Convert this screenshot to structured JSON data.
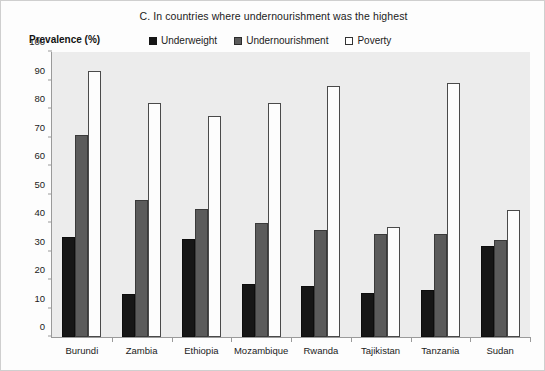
{
  "chart_data": {
    "type": "bar",
    "title": "C. In countries where undernourishment was the highest",
    "xlabel": "",
    "ylabel": "Prevalence (%)",
    "ylim": [
      0,
      100
    ],
    "yticks": [
      0,
      10,
      20,
      30,
      40,
      50,
      60,
      70,
      80,
      90,
      100
    ],
    "grid": false,
    "legend_position": "top",
    "categories": [
      "Burundi",
      "Zambia",
      "Ethiopia",
      "Mozambique",
      "Rwanda",
      "Tajikistan",
      "Tanzania",
      "Sudan"
    ],
    "series": [
      {
        "name": "Underweight",
        "color": "#161616",
        "values": [
          35,
          15,
          34.5,
          18.5,
          18,
          15.5,
          16.5,
          32
        ]
      },
      {
        "name": "Undernourishment",
        "color": "#5b5b5b",
        "values": [
          71,
          48,
          45,
          40,
          37.5,
          36,
          36,
          34
        ]
      },
      {
        "name": "Poverty",
        "color": "#ffffff",
        "values": [
          93.5,
          82,
          77.5,
          82,
          88,
          38.5,
          89,
          44.5
        ]
      }
    ]
  }
}
